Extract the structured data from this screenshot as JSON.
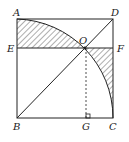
{
  "diagram": {
    "labels": {
      "A": "A",
      "B": "B",
      "C": "C",
      "D": "D",
      "E": "E",
      "F": "F",
      "G": "G",
      "O": "O"
    },
    "colors": {
      "stroke": "#222222",
      "hatch": "#333333",
      "background": "#ffffff"
    }
  }
}
